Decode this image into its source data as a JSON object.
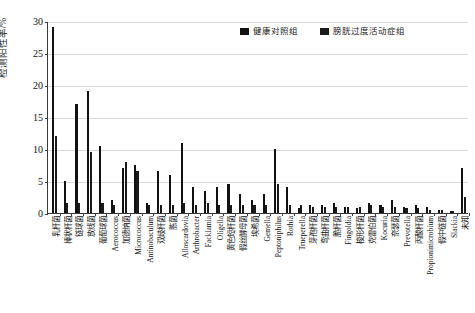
{
  "chart_data": {
    "type": "bar",
    "title": "",
    "xlabel": "",
    "ylabel": "检测阳性率/%",
    "ylim": [
      0,
      30
    ],
    "yticks": [
      0,
      5,
      10,
      15,
      20,
      25,
      30
    ],
    "grid": "horizontal",
    "legend_position": "top-right",
    "categories": [
      "乳杆菌",
      "棒状杆菌",
      "链球菌",
      "放线菌",
      "葡萄球菌",
      "Aerococcus",
      "加德纳菌",
      "Micrococcus",
      "Antinobaculum",
      "双歧杆菌",
      "胨菌",
      "Alloscardovia",
      "Arthrobacter",
      "Facklamia",
      "Oligella",
      "黄色短杆菌",
      "假丝酵母菌",
      "埃希菌",
      "Gemella",
      "Peptoniphilus",
      "Rothia",
      "Trueperella",
      "芽孢杆菌",
      "弯曲杆菌",
      "脆杆菌",
      "Fingoldia",
      "梭形杆菌",
      "克雷伯菌",
      "Kocuria",
      "奈瑟菌",
      "Prevotella",
      "丙酸杆菌",
      "Propionimicrobium",
      "假中链菌",
      "Slackia",
      "未知"
    ],
    "series": [
      {
        "name": "健康对照组",
        "color": "#111111",
        "values": [
          29,
          5,
          17,
          19,
          10.5,
          2,
          7,
          7.5,
          1.5,
          6.5,
          6,
          11,
          4,
          3.5,
          4,
          4.5,
          3,
          2,
          3,
          10,
          4,
          0.8,
          1.2,
          1.2,
          1.5,
          1,
          0.8,
          1.5,
          1.2,
          2,
          1,
          1.2,
          1,
          0.5,
          0.3,
          7
        ]
      },
      {
        "name": "膀胱过度活动症组",
        "color": "#1a1a1a",
        "values": [
          12,
          1.5,
          1.5,
          9.5,
          1.5,
          1.3,
          8,
          6.5,
          1.2,
          1.2,
          1.2,
          1.5,
          1.2,
          1.5,
          1.2,
          1.2,
          1.2,
          1.2,
          1.2,
          4.5,
          1.2,
          1.2,
          1,
          1,
          1,
          1,
          1,
          1.2,
          1,
          1,
          0.8,
          0.8,
          0.5,
          0.4,
          0.3,
          2.5
        ]
      }
    ]
  },
  "legend": {
    "entries": [
      {
        "label": "健康对照组"
      },
      {
        "label": "膀胱过度活动症组"
      }
    ]
  }
}
